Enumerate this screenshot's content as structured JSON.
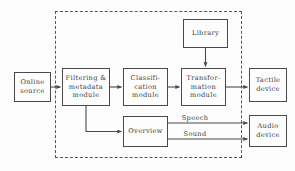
{
  "diagram": {
    "background_color": "#fdfdfd",
    "line_color": "#4a4a4a",
    "text_color": "#3b3b3b",
    "boundary": {
      "name": "system-boundary",
      "style": "dashed"
    },
    "nodes": [
      {
        "id": "online_source",
        "label": "Online\nsource",
        "lines": [
          "Online",
          "source"
        ],
        "x": 14,
        "y": 72,
        "w": 37,
        "h": 30,
        "inside_boundary": false
      },
      {
        "id": "filtering",
        "label": "Filtering &\nmetadata\nmodule",
        "lines": [
          "Filtering &",
          "metadata",
          "module"
        ],
        "x": 62,
        "y": 68,
        "w": 48,
        "h": 38,
        "inside_boundary": true
      },
      {
        "id": "classification",
        "label": "Classifi-\ncation\nmodule",
        "lines": [
          "Classifi-",
          "cation",
          "module"
        ],
        "x": 123,
        "y": 68,
        "w": 45,
        "h": 38,
        "inside_boundary": true
      },
      {
        "id": "transformation",
        "label": "Transfor-\nmation\nmodule",
        "lines": [
          "Transfor-",
          "mation",
          "module"
        ],
        "x": 181,
        "y": 68,
        "w": 45,
        "h": 38,
        "inside_boundary": true
      },
      {
        "id": "library",
        "label": "Library",
        "lines": [
          "Library"
        ],
        "x": 183,
        "y": 19,
        "w": 45,
        "h": 29,
        "inside_boundary": true
      },
      {
        "id": "overview",
        "label": "Overview",
        "lines": [
          "Overview"
        ],
        "x": 123,
        "y": 116,
        "w": 45,
        "h": 31,
        "inside_boundary": true
      },
      {
        "id": "tactile_device",
        "label": "Tactile\ndevice",
        "lines": [
          "Tactile",
          "device"
        ],
        "x": 249,
        "y": 68,
        "w": 38,
        "h": 34,
        "inside_boundary": false
      },
      {
        "id": "audio_device",
        "label": "Audio\ndevice",
        "lines": [
          "Audio",
          "device"
        ],
        "x": 249,
        "y": 115,
        "w": 38,
        "h": 32,
        "inside_boundary": false
      }
    ],
    "edge_labels": [
      {
        "id": "speech",
        "text": "Speech",
        "x": 172,
        "y": 114
      },
      {
        "id": "sound",
        "text": "Sound",
        "x": 172,
        "y": 130
      }
    ],
    "edges": [
      {
        "id": "online-to-filtering",
        "from": "online_source",
        "to": "filtering",
        "label": ""
      },
      {
        "id": "filtering-to-classification",
        "from": "filtering",
        "to": "classification",
        "label": ""
      },
      {
        "id": "classification-to-transformation",
        "from": "classification",
        "to": "transformation",
        "label": ""
      },
      {
        "id": "library-to-transformation",
        "from": "library",
        "to": "transformation",
        "label": ""
      },
      {
        "id": "transformation-to-tactile",
        "from": "transformation",
        "to": "tactile_device",
        "label": ""
      },
      {
        "id": "filtering-to-overview",
        "from": "filtering",
        "to": "overview",
        "label": ""
      },
      {
        "id": "overview-to-audio-speech",
        "from": "overview",
        "to": "audio_device",
        "label": "Speech"
      },
      {
        "id": "overview-to-audio-sound",
        "from": "overview",
        "to": "audio_device",
        "label": "Sound"
      }
    ]
  }
}
